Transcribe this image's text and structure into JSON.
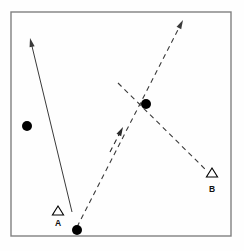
{
  "figure": {
    "title": "",
    "background_color": "#fefefe",
    "frame": {
      "name": "plot-frame",
      "x": 11,
      "y": 12,
      "width": 220,
      "height": 224,
      "stroke_color": "#808080",
      "stroke_width": 1.4
    }
  },
  "chart_data": {
    "type": "scatter",
    "title": "",
    "xlabel": "",
    "ylabel": "",
    "xlim": [
      11,
      231
    ],
    "ylim": [
      12,
      236
    ],
    "grid": false,
    "legend": null,
    "series": [
      {
        "name": "filled-circles",
        "marker": "filled-circle",
        "color": "#000000",
        "radius": 5.0,
        "points": [
          {
            "id": "circle-left",
            "x": 27,
            "y": 126
          },
          {
            "id": "circle-center",
            "x": 146,
            "y": 104
          },
          {
            "id": "circle-bottom",
            "x": 77,
            "y": 230
          }
        ]
      },
      {
        "name": "open-triangles",
        "marker": "open-triangle",
        "color": "#000000",
        "size": 9,
        "points": [
          {
            "id": "triangle-a",
            "x": 58,
            "y": 211,
            "label": "A",
            "label_x": 58,
            "label_y": 226
          },
          {
            "id": "triangle-b",
            "x": 212,
            "y": 173,
            "label": "B",
            "label_x": 212,
            "label_y": 192
          }
        ]
      }
    ],
    "vectors": [
      {
        "id": "solid-arrow-upper-left",
        "style": "solid",
        "color": "#3a3a3a",
        "stroke_width": 1.0,
        "x1": 72,
        "y1": 212,
        "x2": 30,
        "y2": 38,
        "arrow_at": "end"
      },
      {
        "id": "dashed-arrow-upper-right",
        "style": "dashed",
        "color": "#3a3a3a",
        "stroke_width": 1.1,
        "dash": "5,4",
        "x1": 77,
        "y1": 227,
        "x2": 183,
        "y2": 20,
        "arrow_at": "end"
      },
      {
        "id": "dashed-line-to-b",
        "style": "dashed",
        "color": "#3a3a3a",
        "stroke_width": 1.1,
        "dash": "5,4",
        "x1": 118,
        "y1": 83,
        "x2": 206,
        "y2": 170,
        "arrow_at": "none"
      },
      {
        "id": "short-dashed-arrow-middle",
        "style": "dashed",
        "color": "#2a2a2a",
        "stroke_width": 1.1,
        "dash": "5,4",
        "x1": 110,
        "y1": 152,
        "x2": 123,
        "y2": 127,
        "arrow_at": "end"
      }
    ],
    "annotations": [
      {
        "id": "label-a",
        "text": "A",
        "x": 58,
        "y": 226
      },
      {
        "id": "label-b",
        "text": "B",
        "x": 212,
        "y": 192
      }
    ]
  }
}
